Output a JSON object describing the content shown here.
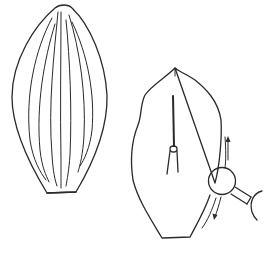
{
  "figure": {
    "colors": {
      "background": "#ffffff",
      "ink": "#2a2a2a"
    },
    "left_shape": {
      "name": "veined-leaf",
      "vein_count": 7
    },
    "right_shape": {
      "name": "leaf-with-pin-and-rotor",
      "elements": [
        "central-pin",
        "pin-socket",
        "rotor-circle",
        "connector-bar",
        "partial-circle",
        "rotation-arrow-up",
        "rotation-arrow-down"
      ]
    }
  }
}
